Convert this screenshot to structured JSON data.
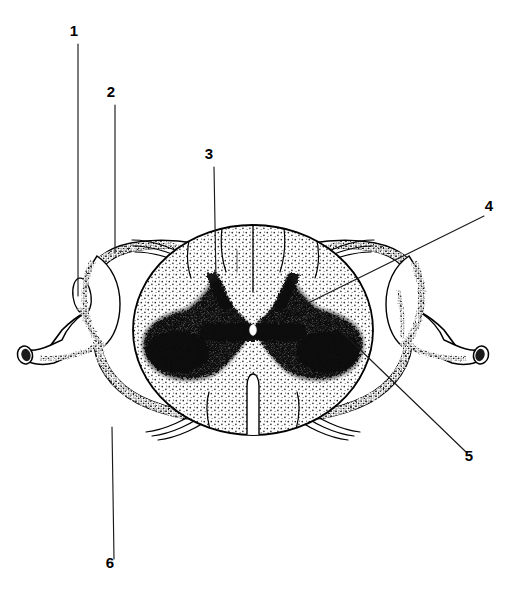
{
  "figure": {
    "background_color": "#ffffff",
    "ink_color": "#000000",
    "label_font_weight": "bold",
    "label_font_size_px": 15
  },
  "labels": [
    {
      "id": "1",
      "text": "1",
      "text_x": 74,
      "text_y": 36,
      "leader": {
        "x1": 78,
        "y1": 44,
        "x2": 78,
        "y2": 296
      },
      "target": "dorsal-root-ganglion-left"
    },
    {
      "id": "2",
      "text": "2",
      "text_x": 111,
      "text_y": 97,
      "leader": {
        "x1": 115,
        "y1": 105,
        "x2": 115,
        "y2": 253
      },
      "target": "dura-mater-superior-left"
    },
    {
      "id": "3",
      "text": "3",
      "text_x": 209,
      "text_y": 159,
      "leader": {
        "x1": 214,
        "y1": 167,
        "x2": 216,
        "y2": 281
      },
      "target": "posterior-funiculus-white-matter"
    },
    {
      "id": "4",
      "text": "4",
      "text_x": 489,
      "text_y": 211,
      "leader": {
        "x1": 484,
        "y1": 216,
        "x2": 292,
        "y2": 311
      },
      "target": "dorsal-horn-gray-matter-right"
    },
    {
      "id": "5",
      "text": "5",
      "text_x": 469,
      "text_y": 461,
      "leader": {
        "x1": 466,
        "y1": 452,
        "x2": 318,
        "y2": 309
      },
      "target": "ventral-horn-gray-matter-right"
    },
    {
      "id": "6",
      "text": "6",
      "text_x": 110,
      "text_y": 568,
      "leader": {
        "x1": 114,
        "y1": 559,
        "x2": 112,
        "y2": 427
      },
      "target": "dura-mater-inferior-left"
    }
  ],
  "structures": [
    {
      "name": "dura-mater-sac",
      "description": "Outer dural sac enclosing the cord, stippled border"
    },
    {
      "name": "spinal-cord-white-matter",
      "description": "Oval central cord, light stipple"
    },
    {
      "name": "gray-matter-butterfly",
      "description": "Dark butterfly/H-shaped central gray matter"
    },
    {
      "name": "central-canal",
      "description": "Small white oval at center of gray commissure"
    },
    {
      "name": "posterior-median-sulcus",
      "description": "Vertical midline cleft at top of cord"
    },
    {
      "name": "anterior-median-fissure",
      "description": "Midline cleft at bottom of cord"
    },
    {
      "name": "dorsal-rootlets-left",
      "description": "Filaments exiting upper left of cord"
    },
    {
      "name": "dorsal-rootlets-right",
      "description": "Filaments exiting upper right of cord"
    },
    {
      "name": "ventral-rootlets-left",
      "description": "Filaments exiting lower left of cord"
    },
    {
      "name": "ventral-rootlets-right",
      "description": "Filaments exiting lower right of cord"
    },
    {
      "name": "spinal-nerve-stump-left",
      "description": "Cut nerve trunk at far left with dark lumen"
    },
    {
      "name": "spinal-nerve-stump-right",
      "description": "Cut nerve trunk at far right with dark lumen"
    },
    {
      "name": "dorsal-root-ganglion-left",
      "description": "Oval swelling inside left dural sleeve"
    }
  ]
}
